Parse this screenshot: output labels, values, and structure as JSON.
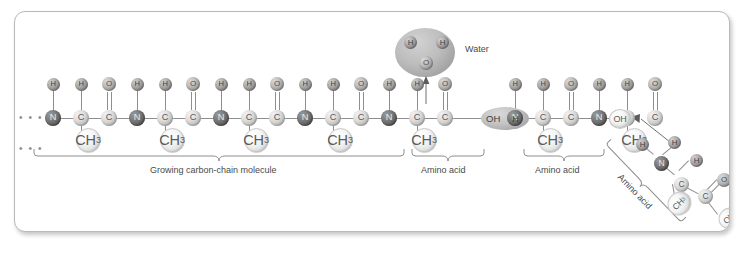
{
  "diagram": {
    "type": "chemical-structure",
    "atom_labels": {
      "nitrogen": "N",
      "carbon": "C",
      "oxygen": "O",
      "hydrogen": "H",
      "methyl": "CH",
      "methyl_subscript": "3",
      "hydroxyl": "OH"
    },
    "colors": {
      "nitrogen": "#5f5f5f",
      "carbon": "#bdbdbd",
      "oxygen": "#9d9d9d",
      "hydrogen": "#8c8c8c",
      "group": "#f0f0f0",
      "bond": "#8e8e8e",
      "highlight": "#bdbdbd",
      "panel_border": "#b9b9b9",
      "text": "#4a4a4a"
    },
    "water_molecule": {
      "label": "Water",
      "atoms": [
        "H",
        "H",
        "O"
      ],
      "formula": "H2O"
    },
    "leaving_group": {
      "left_text": "OH",
      "right_text": "H",
      "combined": "OH H"
    },
    "terminal_group": "OH",
    "continuation_marks": "• • •",
    "captions": [
      {
        "id": "growing-chain",
        "text": "Growing carbon-chain molecule"
      },
      {
        "id": "amino-acid-1",
        "text": "Amino acid"
      },
      {
        "id": "amino-acid-2",
        "text": "Amino acid"
      },
      {
        "id": "amino-acid-3",
        "text": "Amino acid"
      }
    ],
    "backbone_units": [
      {
        "index": 1,
        "atoms": [
          "N",
          "C",
          "C"
        ],
        "top": [
          "H",
          "H",
          "O"
        ],
        "side_group": "CH3"
      },
      {
        "index": 2,
        "atoms": [
          "N",
          "C",
          "C"
        ],
        "top": [
          "H",
          "H",
          "O"
        ],
        "side_group": "CH3"
      },
      {
        "index": 3,
        "atoms": [
          "N",
          "C",
          "C"
        ],
        "top": [
          "H",
          "H",
          "O"
        ],
        "side_group": "CH3"
      },
      {
        "index": 4,
        "atoms": [
          "N",
          "C",
          "C"
        ],
        "top": [
          "H",
          "H",
          "O"
        ],
        "side_group": "CH3"
      },
      {
        "index": 5,
        "atoms": [
          "N",
          "C",
          "C"
        ],
        "top": [
          "H",
          "H",
          "O"
        ],
        "side_group": "CH3"
      },
      {
        "index": 6,
        "atoms": [
          "N",
          "C",
          "C"
        ],
        "top": [
          "H",
          "H",
          "O"
        ],
        "side_group": "CH3"
      },
      {
        "index": 7,
        "atoms": [
          "N",
          "C",
          "C"
        ],
        "top": [
          "H",
          "H",
          "O"
        ],
        "side_group": "CH3"
      }
    ],
    "incoming_amino_acid": {
      "label": "Amino acid",
      "atoms": [
        "H",
        "H",
        "N",
        "H",
        "C",
        "CH3",
        "C",
        "O",
        "OH"
      ],
      "rotated": true
    }
  }
}
